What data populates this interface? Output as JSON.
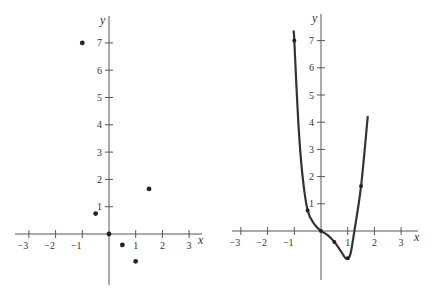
{
  "chart_data": [
    {
      "type": "scatter",
      "title": "",
      "xlabel": "x",
      "ylabel": "y",
      "xlim": [
        -3.5,
        3.8
      ],
      "ylim": [
        -1.9,
        7.6
      ],
      "x_ticks": [
        -3,
        -2,
        -1,
        1,
        2,
        3
      ],
      "y_ticks": [
        1,
        2,
        3,
        4,
        5,
        6,
        7
      ],
      "grid": false,
      "points": [
        {
          "x": -1,
          "y": 7
        },
        {
          "x": -0.5,
          "y": 0.75
        },
        {
          "x": 0,
          "y": 0
        },
        {
          "x": 0.5,
          "y": -0.4
        },
        {
          "x": 1,
          "y": -1
        },
        {
          "x": 1.5,
          "y": 1.65
        }
      ]
    },
    {
      "type": "line",
      "title": "",
      "xlabel": "x",
      "ylabel": "y",
      "xlim": [
        -3.5,
        3.8
      ],
      "ylim": [
        -1.9,
        7.6
      ],
      "x_ticks": [
        -3,
        -2,
        -1,
        1,
        2,
        3
      ],
      "y_ticks": [
        1,
        2,
        3,
        4,
        5,
        6,
        7
      ],
      "grid": false,
      "points": [
        {
          "x": -1,
          "y": 7
        },
        {
          "x": -0.5,
          "y": 0.75
        },
        {
          "x": 0,
          "y": 0
        },
        {
          "x": 0.5,
          "y": -0.4
        },
        {
          "x": 1,
          "y": -1
        },
        {
          "x": 1.5,
          "y": 1.65
        }
      ],
      "curve": [
        {
          "x": -1.02,
          "y": 7.3
        },
        {
          "x": -1,
          "y": 7
        },
        {
          "x": -0.85,
          "y": 4.0
        },
        {
          "x": -0.7,
          "y": 2.1
        },
        {
          "x": -0.5,
          "y": 0.75
        },
        {
          "x": -0.25,
          "y": 0.25
        },
        {
          "x": 0,
          "y": 0
        },
        {
          "x": 0.25,
          "y": -0.15
        },
        {
          "x": 0.5,
          "y": -0.4
        },
        {
          "x": 0.75,
          "y": -0.75
        },
        {
          "x": 0.95,
          "y": -1.02
        },
        {
          "x": 1.1,
          "y": -0.85
        },
        {
          "x": 1.25,
          "y": 0
        },
        {
          "x": 1.5,
          "y": 1.65
        },
        {
          "x": 1.75,
          "y": 4.2
        }
      ]
    }
  ],
  "labels": {
    "x_axis": "x",
    "y_axis": "y",
    "x_ticks": [
      "−3",
      "−2",
      "−1",
      "1",
      "2",
      "3"
    ],
    "y_ticks": [
      "1",
      "2",
      "3",
      "4",
      "5",
      "6",
      "7"
    ]
  }
}
